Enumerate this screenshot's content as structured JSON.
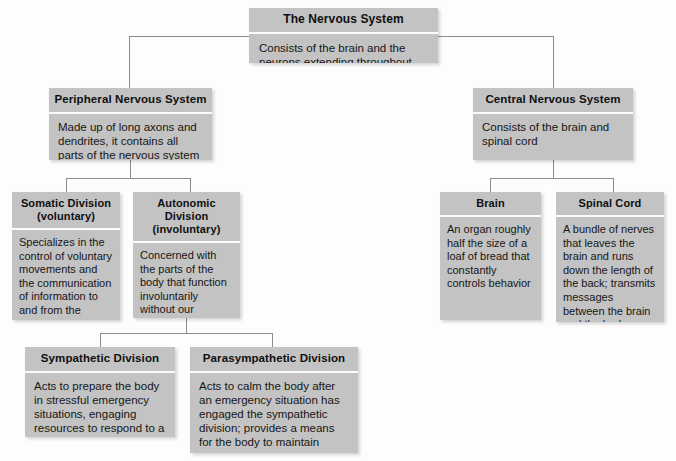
{
  "diagram": {
    "nodes": {
      "root": {
        "header": "The Nervous System",
        "body": "Consists of the brain and the neurons extending throughout the body"
      },
      "peripheral": {
        "header": "Peripheral Nervous System",
        "body": "Made up of long axons and dendrites, it contains all parts of the nervous system other than the brain and spinal cord"
      },
      "central": {
        "header": "Central Nervous System",
        "body": "Consists of the brain and spinal cord"
      },
      "somatic": {
        "header": "Somatic Division (voluntary)",
        "body": "Specializes in the control of voluntary movements and the communication of information to and from the sense organs"
      },
      "autonomic": {
        "header": "Autonomic Division (involuntary)",
        "body": "Concerned with the parts of the body that function involuntarily without our awareness"
      },
      "brain": {
        "header": "Brain",
        "body": "An organ roughly half the size of a loaf of bread that constantly controls behavior"
      },
      "spinal_cord": {
        "header": "Spinal Cord",
        "body": "A bundle of nerves that leaves the brain and runs down the length of the back; transmits messages between the brain and the body"
      },
      "sympathetic": {
        "header": "Sympathetic Division",
        "body": "Acts to prepare the body in stressful emergency situations, engaging resources to respond to a threat"
      },
      "parasympathetic": {
        "header": "Parasympathetic Division",
        "body": "Acts to calm the body after an emergency situation has engaged the sympathetic division; provides a means for the body to maintain storage of energy sources"
      }
    },
    "colors": {
      "box_fill": "#c3c3c3",
      "divider": "#fbfbfb",
      "connector": "#8c8c8c",
      "background": "#fdfdfd",
      "text": "#101010"
    }
  }
}
